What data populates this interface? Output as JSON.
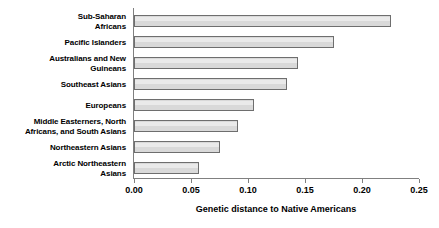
{
  "chart_data": {
    "type": "bar",
    "orientation": "horizontal",
    "title": "",
    "xlabel": "Genetic distance to Native Americans",
    "ylabel": "",
    "categories": [
      "Sub-Saharan\nAfricans",
      "Pacific Islanders",
      "Australians and New\nGuineans",
      "Southeast Asians",
      "Europeans",
      "Middle Easterners, North\nAfricans, and South Asians",
      "Northeastern Asians",
      "Arctic Northeastern\nAsians"
    ],
    "values": [
      0.225,
      0.175,
      0.144,
      0.134,
      0.105,
      0.091,
      0.075,
      0.057
    ],
    "xlim": [
      0.0,
      0.25
    ],
    "xticks": [
      0.0,
      0.05,
      0.1,
      0.15,
      0.2,
      0.25
    ],
    "xtick_labels": [
      "0.00",
      "0.05",
      "0.10",
      "0.15",
      "0.20",
      "0.25"
    ],
    "grid": false,
    "legend": null,
    "bar_fill_color": "#d9d9d9",
    "bar_edge_color": "#6e6e6e",
    "axis_color": "#808080",
    "background_color": "#ffffff"
  }
}
